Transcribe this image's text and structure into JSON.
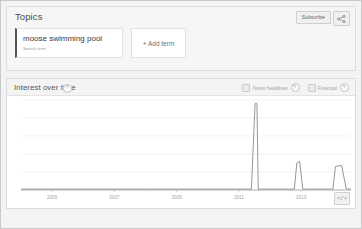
{
  "topics": {
    "title": "Topics",
    "subscribe_label": "Subscribe",
    "share_icon": "share-icon",
    "terms": [
      {
        "label": "moose swimming pool",
        "sublabel": "Search term"
      }
    ],
    "add_term_label": "+ Add term"
  },
  "interest": {
    "title": "Interest over time",
    "help_icon": "help-question-icon",
    "options": [
      {
        "label": "News headlines",
        "checked": false,
        "help_icon": "help-question-icon"
      },
      {
        "label": "Forecast",
        "checked": false,
        "help_icon": "help-question-icon"
      }
    ],
    "embed_label": "</>"
  },
  "colors": {
    "line": "#8a8a8a",
    "accent": "#555555",
    "page_bg": "#f3f3f3",
    "card_bg": "#ffffff",
    "grid": "#efefef"
  },
  "chart_data": {
    "type": "line",
    "title": "Interest over time",
    "xlabel": "",
    "ylabel": "",
    "grid": true,
    "legend": "none",
    "ylim": [
      0,
      100
    ],
    "gridline_values": [
      100,
      80,
      60,
      40,
      20,
      0
    ],
    "tick_labels": [
      "2005",
      "2007",
      "2009",
      "2011",
      "2013"
    ],
    "tick_x": [
      2005,
      2007,
      2009,
      2011,
      2013
    ],
    "xlim": [
      2004.0,
      2014.6
    ],
    "series": [
      {
        "name": "moose swimming pool",
        "color": "#8a8a8a",
        "x": [
          2004.0,
          2005.0,
          2006.0,
          2007.0,
          2008.0,
          2009.0,
          2010.0,
          2011.0,
          2011.4,
          2011.52,
          2011.58,
          2011.62,
          2011.72,
          2012.0,
          2012.6,
          2012.78,
          2012.86,
          2012.95,
          2013.05,
          2013.2,
          2013.6,
          2014.02,
          2014.1,
          2014.2,
          2014.3,
          2014.45,
          2014.6
        ],
        "y": [
          1,
          1,
          1,
          1,
          1,
          1,
          1,
          1,
          1,
          96,
          96,
          1,
          1,
          1,
          1,
          1,
          30,
          32,
          1,
          1,
          1,
          1,
          26,
          27,
          27,
          1,
          1
        ]
      }
    ],
    "annotations": [
      {
        "text": "major spike",
        "x": 2011.55,
        "y": 96
      }
    ]
  }
}
